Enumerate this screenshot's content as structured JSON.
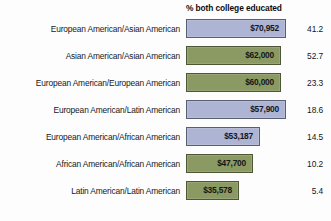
{
  "chart_data": {
    "type": "bar",
    "orientation": "horizontal",
    "title": "",
    "xlabel": "",
    "ylabel": "",
    "column_header": "% both college educated",
    "categories": [
      "European American/Asian American",
      "Asian American/Asian American",
      "European American/European American",
      "European American/Latin American",
      "European American/African American",
      "African American/African American",
      "Latin American/Latin American"
    ],
    "value_labels": [
      "$70,952",
      "$62,000",
      "$60,000",
      "$57,900",
      "$53,187",
      "$47,700",
      "$35,578"
    ],
    "values": [
      70952,
      62000,
      60000,
      57900,
      53187,
      47700,
      35578
    ],
    "pct_college_educated_labels": [
      "41.2",
      "52.7",
      "23.3",
      "18.6",
      "14.5",
      "10.2",
      "5.4"
    ],
    "pct_college_educated": [
      41.2,
      52.7,
      23.3,
      18.6,
      14.5,
      10.2,
      5.4
    ],
    "bar_colors": [
      "blue",
      "green",
      "green",
      "blue",
      "blue",
      "green",
      "green"
    ],
    "xlim": [
      0,
      70952
    ],
    "grid": false,
    "legend": "none"
  },
  "colors": {
    "bar_blue": "#aeb4d4",
    "bar_blue_border": "#595f73",
    "bar_green": "#8a9a62",
    "bar_green_border": "#4d5635",
    "background": "#fdfdfd",
    "text": "#14171a"
  },
  "rows": [
    {
      "label": "European American/Asian American",
      "value_label": "$70,952",
      "value": 70952,
      "pct": "41.2",
      "color": "blue",
      "bar_width_px": 100
    },
    {
      "label": "Asian American/Asian American",
      "value_label": "$62,000",
      "value": 62000,
      "pct": "52.7",
      "color": "green",
      "bar_width_px": 95
    },
    {
      "label": "European American/European American",
      "value_label": "$60,000",
      "value": 60000,
      "pct": "23.3",
      "color": "green",
      "bar_width_px": 95
    },
    {
      "label": "European American/Latin American",
      "value_label": "$57,900",
      "value": 57900,
      "pct": "18.6",
      "color": "blue",
      "bar_width_px": 100
    },
    {
      "label": "European American/African American",
      "value_label": "$53,187",
      "value": 53187,
      "pct": "14.5",
      "color": "blue",
      "bar_width_px": 74
    },
    {
      "label": "African American/African American",
      "value_label": "$47,700",
      "value": 47700,
      "pct": "10.2",
      "color": "green",
      "bar_width_px": 67
    },
    {
      "label": "Latin American/Latin American",
      "value_label": "$35,578",
      "value": 35578,
      "pct": "5.4",
      "color": "green",
      "bar_width_px": 53
    }
  ]
}
